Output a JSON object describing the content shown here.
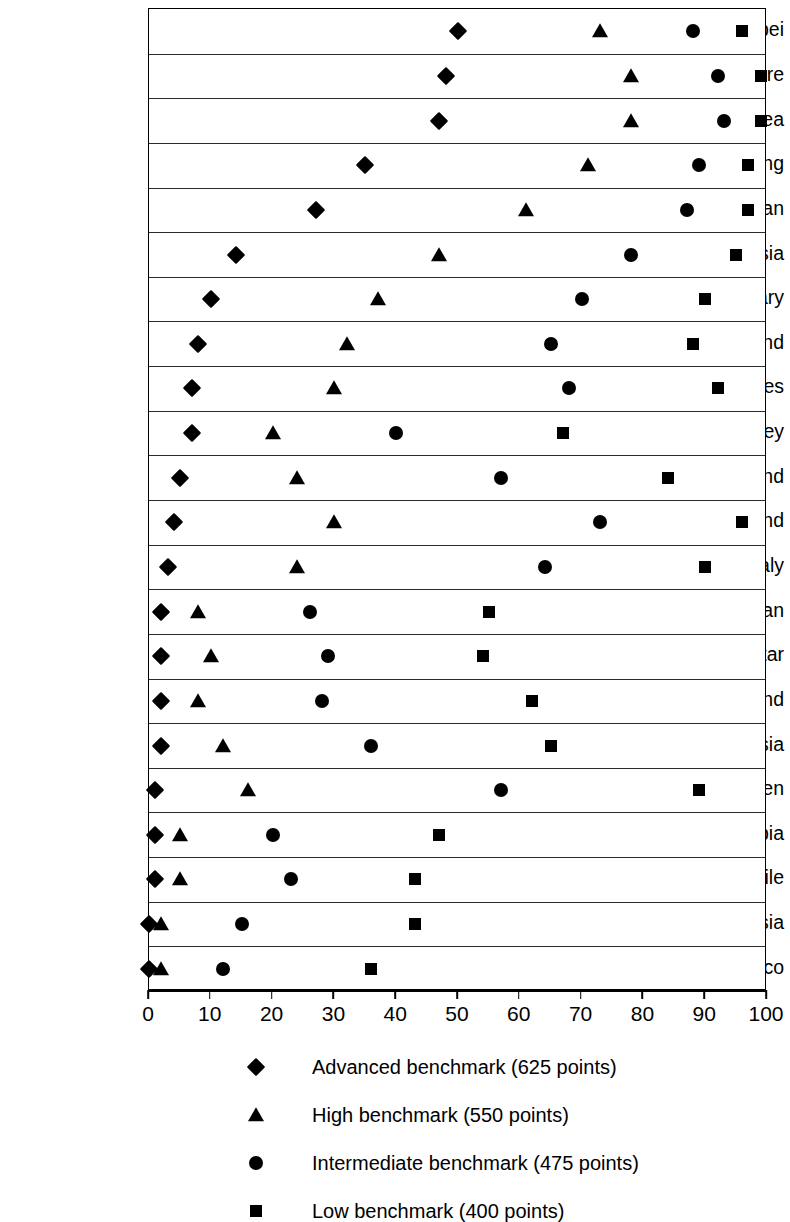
{
  "chart_data": {
    "type": "scatter",
    "title": "",
    "subtitle": "",
    "xlabel": "",
    "ylabel": "",
    "xlim": [
      0,
      100
    ],
    "ylim": null,
    "grid": "horizontal-row-separators",
    "legend_position": "bottom",
    "xticks": [
      0,
      10,
      20,
      30,
      40,
      50,
      60,
      70,
      80,
      90,
      100
    ],
    "xtick_labels": [
      "0",
      "10",
      "20",
      "30",
      "40",
      "50",
      "60",
      "70",
      "80",
      "90",
      "100"
    ],
    "categories": [
      "Chinese Taipei",
      "Singapore",
      "South Korea",
      "Hong Kong",
      "Japan",
      "Russia",
      "Hungary",
      "England",
      "United States",
      "Turkey",
      "New Zealand",
      "Finland",
      "Italy",
      "Iran",
      "Qatar",
      "Thailand",
      "Malaysia",
      "Sweden",
      "Saudi Arabia",
      "Chile",
      "Indonesia",
      "Morocco"
    ],
    "series": [
      {
        "name": "Advanced benchmark (625 points)",
        "marker": "diamond",
        "color": "#000000",
        "values": [
          50,
          48,
          47,
          35,
          27,
          14,
          10,
          8,
          7,
          7,
          5,
          4,
          3,
          2,
          2,
          2,
          2,
          1,
          1,
          1,
          0,
          0
        ]
      },
      {
        "name": "High benchmark (550 points)",
        "marker": "triangle",
        "color": "#000000",
        "values": [
          73,
          78,
          78,
          71,
          61,
          47,
          37,
          32,
          30,
          20,
          24,
          30,
          24,
          8,
          10,
          8,
          12,
          16,
          5,
          5,
          2,
          2
        ]
      },
      {
        "name": "Intermediate benchmark (475 points)",
        "marker": "circle",
        "color": "#000000",
        "values": [
          88,
          92,
          93,
          89,
          87,
          78,
          70,
          65,
          68,
          40,
          57,
          73,
          64,
          26,
          29,
          28,
          36,
          57,
          20,
          23,
          15,
          12
        ]
      },
      {
        "name": "Low benchmark (400 points)",
        "marker": "square",
        "color": "#000000",
        "values": [
          96,
          99,
          99,
          97,
          97,
          95,
          90,
          88,
          92,
          67,
          84,
          96,
          90,
          55,
          54,
          62,
          65,
          89,
          47,
          43,
          43,
          36
        ]
      }
    ]
  },
  "legend": {
    "items": [
      {
        "symbol": "diamond",
        "label": "Advanced benchmark (625 points)"
      },
      {
        "symbol": "triangle",
        "label": "High benchmark (550 points)"
      },
      {
        "symbol": "circle",
        "label": "Intermediate benchmark (475 points)"
      },
      {
        "symbol": "square",
        "label": "Low benchmark (400 points)"
      }
    ]
  }
}
